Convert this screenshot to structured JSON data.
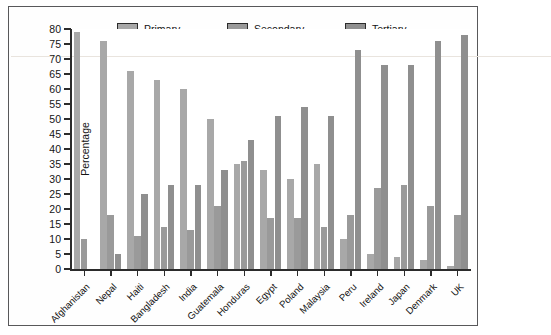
{
  "chart_data": {
    "type": "bar",
    "title": "",
    "xlabel": "",
    "ylabel": "Percentage",
    "ylim": [
      0,
      80
    ],
    "ytick_step": 5,
    "yticks": [
      0,
      5,
      10,
      15,
      20,
      25,
      30,
      35,
      40,
      45,
      50,
      55,
      60,
      65,
      70,
      75,
      80
    ],
    "grid": false,
    "legend_position": "top",
    "categories": [
      "Afghanistan",
      "Nepal",
      "Haiti",
      "Bangladesh",
      "India",
      "Guatemala",
      "Honduras",
      "Egypt",
      "Poland",
      "Malaysia",
      "Peru",
      "Ireland",
      "Japan",
      "Denmark",
      "UK"
    ],
    "series": [
      {
        "name": "Primary",
        "color": "#a8a8a8",
        "values": [
          79,
          76,
          66,
          63,
          60,
          50,
          35,
          33,
          30,
          35,
          10,
          5,
          4,
          3,
          1
        ]
      },
      {
        "name": "Secondary",
        "color": "#9a9a9a",
        "values": [
          10,
          18,
          11,
          14,
          13,
          21,
          36,
          17,
          17,
          14,
          18,
          27,
          28,
          21,
          18
        ]
      },
      {
        "name": "Tertiary",
        "color": "#8f8f8f",
        "values": [
          0,
          5,
          25,
          28,
          28,
          33,
          43,
          51,
          54,
          51,
          73,
          68,
          68,
          76,
          78
        ]
      }
    ]
  },
  "legend": {
    "items": [
      {
        "label": "Primary",
        "swatch": "legend-swatch-primary"
      },
      {
        "label": "Secondary",
        "swatch": "legend-swatch-secondary"
      },
      {
        "label": "Tertiary",
        "swatch": "legend-swatch-tertiary"
      }
    ]
  }
}
